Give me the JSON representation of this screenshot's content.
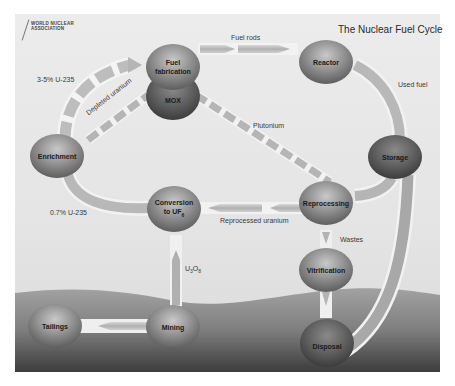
{
  "title": "The Nuclear Fuel Cycle",
  "logo": {
    "line1": "WORLD NUCLEAR",
    "line2": "ASSOCIATION"
  },
  "nodes": {
    "fuel_fabrication": "Fuel fabrication",
    "mox": "MOX",
    "reactor": "Reactor",
    "storage": "Storage",
    "enrichment": "Enrichment",
    "conversion": "Conversion to UF6",
    "reprocessing": "Reprocessing",
    "vitrification": "Vitrification",
    "mining": "Mining",
    "tailings": "Tailings",
    "disposal": "Disposal"
  },
  "flows": {
    "fuel_rods": "Fuel rods",
    "used_fuel": "Used fuel",
    "enriched": "3-5% U-235",
    "depleted_uranium": "Depleted uranium",
    "plutonium": "Plutonium",
    "natural": "0.7% U-235",
    "reprocessed_uranium": "Reprocessed uranium",
    "wastes": "Wastes",
    "u3o8": "U3O8"
  },
  "colors": {
    "node_dark": "#5a5a5a",
    "node_mid": "#8c8c8c",
    "node_light": "#c8c8c8",
    "ground_top": "#9a9a9a",
    "ground_bottom": "#3e3e3e",
    "arrow": "#b5b5b5"
  }
}
